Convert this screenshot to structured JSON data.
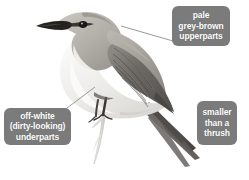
{
  "figure": {
    "background_color": "#ffffff"
  },
  "style": {
    "callout_background": "#7b7b7b",
    "callout_text_color": "#ffffff",
    "leader_line_color": "#8d8d8d"
  },
  "callouts": [
    {
      "id": "upperparts",
      "name": "callout-upperparts",
      "position": "top-right",
      "lines": [
        "pale",
        "grey-brown",
        "upperparts"
      ],
      "has_leader_line": true,
      "points_to": "bird back / mantle"
    },
    {
      "id": "underparts",
      "name": "callout-underparts",
      "position": "bottom-left",
      "lines": [
        "off-white",
        "(dirty-looking)",
        "underparts"
      ],
      "has_leader_line": true,
      "points_to": "bird breast / belly"
    },
    {
      "id": "size",
      "name": "callout-size",
      "position": "bottom-right",
      "lines": [
        "smaller",
        "than a",
        "thrush"
      ],
      "has_leader_line": false,
      "points_to": ""
    }
  ],
  "bird_parts": {
    "bill": "dark, slender, pointed",
    "eye_stripe": "dark line through eye",
    "crown": "pale grey-brown",
    "throat": "off-white",
    "wing": "dark grey-brown with pale feather edges",
    "tail": "long, dark, pointed, angled down-right",
    "legs": "dark, gripping pale vertical branch",
    "perch": "pale bare twig / branch"
  }
}
